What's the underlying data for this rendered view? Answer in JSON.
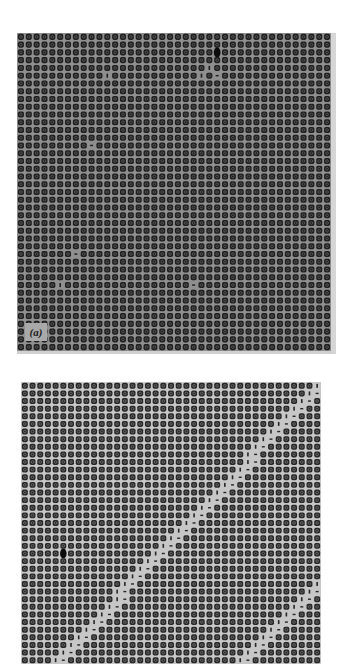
{
  "figure": {
    "panels": [
      {
        "id": "a",
        "label": "(a)",
        "lattice": {
          "columns": 40,
          "rows": 41,
          "dot_color": "#1e1e1e",
          "ring_color": "#5a5a5a",
          "background_color": "#8f8f8f"
        },
        "defects": [
          {
            "type": "dark-cluster",
            "col": 25,
            "row": 2
          },
          {
            "type": "vacancy-bar",
            "col": 24,
            "row": 4
          },
          {
            "type": "vacancy-dash",
            "col": 25,
            "row": 5
          },
          {
            "type": "vacancy-bar",
            "col": 23,
            "row": 5
          },
          {
            "type": "vacancy-bar",
            "col": 11,
            "row": 5
          },
          {
            "type": "vacancy-dash",
            "col": 9,
            "row": 14
          },
          {
            "type": "vacancy-dash",
            "col": 7,
            "row": 28
          },
          {
            "type": "vacancy-bar",
            "col": 5,
            "row": 32
          },
          {
            "type": "vacancy-dash",
            "col": 22,
            "row": 32
          }
        ]
      },
      {
        "id": "b",
        "label": "",
        "lattice": {
          "columns": 39,
          "rows": 37,
          "dot_color": "#262626",
          "ring_color": "#6e6e6e",
          "background_color": "#c7c7c7"
        },
        "diagonal_faults": [
          {
            "start": {
              "col": 38,
              "row": 0
            },
            "end": {
              "col": 3,
              "row": 37
            }
          },
          {
            "start": {
              "col": 38,
              "row": 26
            },
            "end": {
              "col": 27,
              "row": 37
            }
          }
        ],
        "defects": [
          {
            "type": "dark-cluster",
            "col": 5,
            "row": 22
          }
        ]
      }
    ]
  }
}
